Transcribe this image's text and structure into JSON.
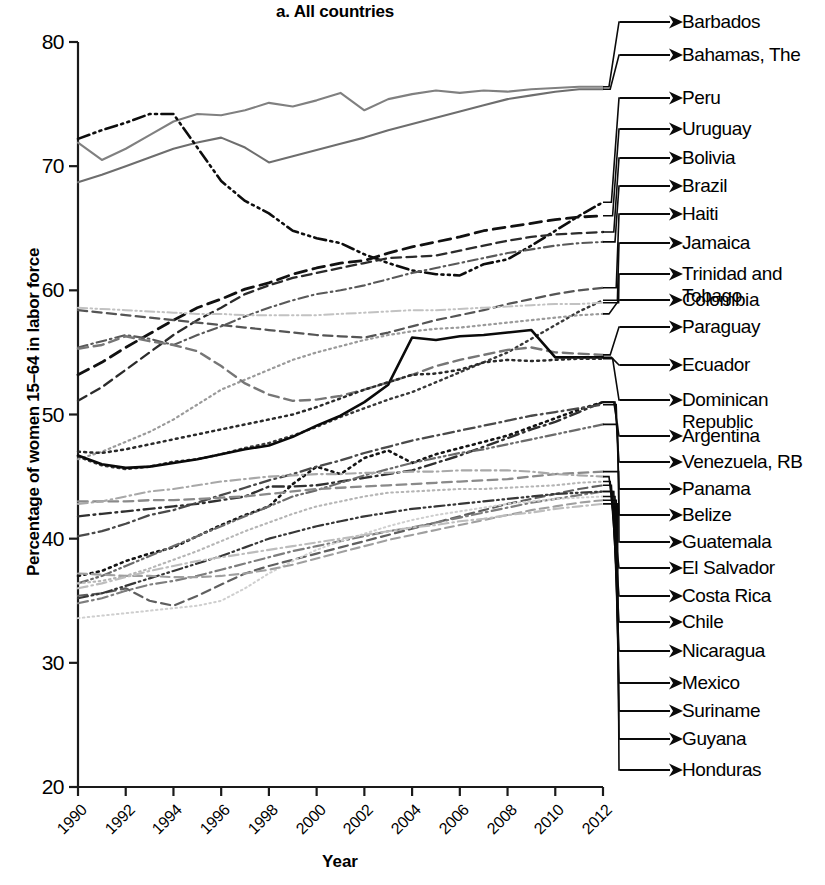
{
  "chart_data": {
    "type": "line",
    "title": "a. All countries",
    "xlabel": "Year",
    "ylabel": "Percentage of women 15–64 in labor force",
    "xlim": [
      1990,
      2012
    ],
    "ylim": [
      20,
      80
    ],
    "xticks": [
      "1990",
      "1992",
      "1994",
      "1996",
      "1998",
      "2000",
      "2002",
      "2004",
      "2006",
      "2008",
      "2010",
      "2012"
    ],
    "yticks": [
      "20",
      "30",
      "40",
      "50",
      "60",
      "70",
      "80"
    ],
    "grid": false,
    "legend_position": "right-leader-lines",
    "x": [
      1990,
      1991,
      1992,
      1993,
      1994,
      1995,
      1996,
      1997,
      1998,
      1999,
      2000,
      2001,
      2002,
      2003,
      2004,
      2005,
      2006,
      2007,
      2008,
      2009,
      2010,
      2011,
      2012
    ],
    "series": [
      {
        "name": "Barbados",
        "style": "solid",
        "shade": "#808080",
        "width": 2.1,
        "values": [
          71.9,
          70.5,
          71.4,
          72.5,
          73.6,
          74.2,
          74.1,
          74.5,
          75.1,
          74.8,
          75.3,
          75.9,
          74.5,
          75.4,
          75.8,
          76.1,
          75.9,
          76.1,
          76.0,
          76.2,
          76.3,
          76.4,
          76.4
        ]
      },
      {
        "name": "Bahamas, The",
        "style": "solid",
        "shade": "#6e6e6e",
        "width": 2.1,
        "values": [
          68.7,
          69.3,
          70.0,
          70.7,
          71.4,
          71.9,
          72.3,
          71.5,
          70.3,
          70.8,
          71.3,
          71.8,
          72.3,
          72.9,
          73.4,
          73.9,
          74.4,
          74.9,
          75.4,
          75.7,
          76.0,
          76.2,
          76.2
        ]
      },
      {
        "name": "Peru",
        "style": "dashdotdot",
        "shade": "#0d0d0d",
        "width": 2.6,
        "values": [
          72.2,
          72.9,
          73.5,
          74.2,
          74.2,
          71.5,
          68.8,
          67.2,
          66.2,
          64.8,
          64.2,
          63.8,
          62.9,
          62.2,
          61.6,
          61.3,
          61.2,
          62.1,
          62.5,
          63.6,
          64.8,
          66.0,
          67.1
        ]
      },
      {
        "name": "Uruguay",
        "style": "dashed",
        "shade": "#111111",
        "width": 2.8,
        "values": [
          53.2,
          54.2,
          55.4,
          56.5,
          57.6,
          58.6,
          59.3,
          60.1,
          60.6,
          61.3,
          61.8,
          62.2,
          62.4,
          63.0,
          63.5,
          63.9,
          64.3,
          64.8,
          65.1,
          65.4,
          65.7,
          65.9,
          66.0
        ]
      },
      {
        "name": "Bolivia",
        "style": "dashed",
        "shade": "#2b2b2b",
        "width": 2.3,
        "values": [
          51.1,
          52.2,
          53.6,
          55.0,
          56.4,
          57.6,
          58.6,
          59.7,
          60.4,
          61.0,
          61.4,
          61.8,
          62.2,
          62.6,
          62.7,
          62.8,
          63.2,
          63.6,
          64.0,
          64.3,
          64.5,
          64.6,
          64.7
        ]
      },
      {
        "name": "Brazil",
        "style": "dashdot",
        "shade": "#595959",
        "width": 2.1,
        "values": [
          55.4,
          55.9,
          56.4,
          56.1,
          55.6,
          56.4,
          57.1,
          57.9,
          58.6,
          59.2,
          59.7,
          60.0,
          60.4,
          60.9,
          61.4,
          61.8,
          62.2,
          62.6,
          63.0,
          63.3,
          63.6,
          63.8,
          63.9
        ]
      },
      {
        "name": "Haiti",
        "style": "dashed",
        "shade": "#555555",
        "width": 2.2,
        "values": [
          58.4,
          58.2,
          58.0,
          57.8,
          57.6,
          57.4,
          57.2,
          57.0,
          56.8,
          56.6,
          56.4,
          56.3,
          56.2,
          56.6,
          57.1,
          57.6,
          58.0,
          58.4,
          58.9,
          59.3,
          59.7,
          60.0,
          60.2
        ]
      },
      {
        "name": "Jamaica",
        "style": "dotted",
        "shade": "#383838",
        "width": 2.4,
        "values": [
          46.6,
          45.9,
          45.6,
          45.8,
          46.2,
          46.4,
          46.8,
          47.3,
          47.7,
          48.3,
          49.0,
          49.8,
          50.5,
          51.2,
          51.8,
          52.6,
          53.4,
          54.2,
          55.0,
          56.1,
          57.2,
          58.3,
          59.2
        ]
      },
      {
        "name": "Trinidad and Tobago",
        "style": "dashdotdot",
        "shade": "#c2c2c2",
        "width": 2.0,
        "values": [
          58.6,
          58.5,
          58.4,
          58.3,
          58.2,
          58.1,
          58.1,
          58.0,
          58.0,
          58.0,
          58.0,
          58.1,
          58.2,
          58.3,
          58.4,
          58.4,
          58.5,
          58.6,
          58.7,
          58.8,
          58.9,
          58.9,
          59.0
        ]
      },
      {
        "name": "Colombia",
        "style": "dotted",
        "shade": "#9a9a9a",
        "width": 2.2,
        "values": [
          46.4,
          47.0,
          47.8,
          48.6,
          49.6,
          50.8,
          52.0,
          52.8,
          53.6,
          54.4,
          55.0,
          55.5,
          56.0,
          56.4,
          56.7,
          56.9,
          57.0,
          57.2,
          57.4,
          57.6,
          57.8,
          58.0,
          58.1
        ]
      },
      {
        "name": "Paraguay",
        "style": "dashed",
        "shade": "#767676",
        "width": 2.4,
        "values": [
          55.3,
          55.6,
          56.3,
          55.9,
          55.6,
          55.1,
          53.9,
          52.5,
          51.6,
          51.1,
          51.2,
          51.5,
          52.0,
          52.6,
          53.2,
          53.9,
          54.4,
          54.8,
          55.2,
          55.4,
          55.0,
          54.9,
          54.8
        ]
      },
      {
        "name": "Ecuador",
        "style": "solid",
        "shade": "#0a0a0a",
        "width": 2.6,
        "values": [
          46.7,
          46.0,
          45.7,
          45.8,
          46.1,
          46.4,
          46.8,
          47.2,
          47.5,
          48.2,
          49.1,
          49.9,
          51.0,
          52.4,
          56.2,
          56.0,
          56.3,
          56.4,
          56.6,
          56.8,
          54.6,
          54.6,
          54.6
        ]
      },
      {
        "name": "Dominican Republic",
        "style": "dotted",
        "shade": "#2a2a2a",
        "width": 2.5,
        "values": [
          47.0,
          46.9,
          47.2,
          47.6,
          48.0,
          48.4,
          48.8,
          49.2,
          49.6,
          50.0,
          50.6,
          51.3,
          52.0,
          52.6,
          53.2,
          53.3,
          53.6,
          54.2,
          54.4,
          54.3,
          54.4,
          54.5,
          54.5
        ]
      },
      {
        "name": "Argentina",
        "style": "dashdot",
        "shade": "#303030",
        "width": 2.4,
        "values": [
          41.8,
          42.0,
          42.2,
          42.4,
          42.6,
          42.8,
          43.1,
          43.4,
          44.2,
          44.2,
          44.3,
          44.6,
          44.9,
          45.2,
          45.5,
          46.1,
          46.7,
          47.4,
          48.1,
          48.8,
          49.4,
          50.2,
          51.0
        ]
      },
      {
        "name": "Venezuela, RB",
        "style": "dotted",
        "shade": "#141414",
        "width": 2.6,
        "values": [
          37.0,
          37.4,
          38.2,
          38.8,
          39.3,
          40.2,
          41.1,
          41.9,
          42.6,
          44.4,
          45.8,
          45.2,
          46.5,
          47.1,
          46.1,
          46.8,
          47.3,
          47.8,
          48.3,
          49.0,
          49.7,
          50.4,
          51.0
        ]
      },
      {
        "name": "Panama",
        "style": "dashdot",
        "shade": "#4a4a4a",
        "width": 2.3,
        "values": [
          40.2,
          40.6,
          41.2,
          41.9,
          42.3,
          42.9,
          43.5,
          44.1,
          44.7,
          45.2,
          45.8,
          46.3,
          46.9,
          47.4,
          47.9,
          48.3,
          48.7,
          49.1,
          49.5,
          49.9,
          50.2,
          50.5,
          50.8
        ]
      },
      {
        "name": "Belize",
        "style": "dashdotdot",
        "shade": "#6b6b6b",
        "width": 2.2,
        "values": [
          36.4,
          37.0,
          37.8,
          38.6,
          39.4,
          40.2,
          41.0,
          41.8,
          42.6,
          43.4,
          43.9,
          44.5,
          45.1,
          45.6,
          46.1,
          46.5,
          46.9,
          47.2,
          47.6,
          48.0,
          48.4,
          48.8,
          49.2
        ]
      },
      {
        "name": "Guatemala",
        "style": "dashed",
        "shade": "#8a8a8a",
        "width": 2.3,
        "values": [
          43.0,
          43.0,
          43.0,
          43.1,
          43.1,
          43.2,
          43.3,
          43.4,
          43.6,
          43.8,
          44.0,
          44.1,
          44.2,
          44.3,
          44.4,
          44.5,
          44.6,
          44.7,
          44.8,
          45.0,
          45.2,
          45.3,
          45.4
        ]
      },
      {
        "name": "El Salvador",
        "style": "dashdot",
        "shade": "#a8a8a8",
        "width": 2.1,
        "values": [
          42.8,
          43.0,
          43.4,
          43.8,
          44.0,
          44.3,
          44.6,
          44.8,
          45.0,
          45.1,
          45.2,
          45.2,
          45.3,
          45.3,
          45.4,
          45.4,
          45.5,
          45.5,
          45.5,
          45.4,
          45.2,
          45.1,
          45.0
        ]
      },
      {
        "name": "Costa Rica",
        "style": "dotted",
        "shade": "#b5b5b5",
        "width": 2.1,
        "values": [
          36.4,
          36.6,
          37.0,
          37.6,
          38.3,
          39.0,
          39.8,
          40.6,
          41.3,
          42.0,
          42.6,
          43.0,
          43.4,
          43.7,
          43.8,
          43.9,
          44.0,
          44.0,
          44.1,
          44.2,
          44.3,
          44.5,
          44.6
        ]
      },
      {
        "name": "Chile",
        "style": "dashed",
        "shade": "#5f5f5f",
        "width": 2.2,
        "values": [
          35.4,
          35.6,
          36.0,
          35.0,
          34.6,
          35.4,
          36.3,
          37.2,
          37.8,
          38.3,
          38.8,
          39.3,
          39.8,
          40.3,
          40.8,
          41.3,
          41.8,
          42.3,
          42.8,
          43.2,
          43.6,
          44.0,
          44.3
        ]
      },
      {
        "name": "Nicaragua",
        "style": "dashdot",
        "shade": "#7d7d7d",
        "width": 2.2,
        "values": [
          34.8,
          35.2,
          35.8,
          36.3,
          36.6,
          37.0,
          37.5,
          38.0,
          38.5,
          39.0,
          39.4,
          39.8,
          40.2,
          40.6,
          40.9,
          41.3,
          41.7,
          42.1,
          42.5,
          42.9,
          43.2,
          43.5,
          43.8
        ]
      },
      {
        "name": "Mexico",
        "style": "dashdotdot",
        "shade": "#373737",
        "width": 2.2,
        "values": [
          35.2,
          35.6,
          36.2,
          36.8,
          37.4,
          38.0,
          38.6,
          39.3,
          40.0,
          40.5,
          41.0,
          41.4,
          41.8,
          42.1,
          42.4,
          42.6,
          42.8,
          43.0,
          43.2,
          43.4,
          43.6,
          43.7,
          43.8
        ]
      },
      {
        "name": "Suriname",
        "style": "dotted",
        "shade": "#cfcfcf",
        "width": 2.0,
        "values": [
          33.6,
          33.8,
          34.0,
          34.2,
          34.4,
          34.6,
          35.0,
          36.0,
          37.2,
          38.2,
          39.1,
          39.8,
          40.4,
          41.0,
          41.5,
          41.9,
          42.2,
          42.5,
          42.8,
          43.0,
          43.2,
          43.3,
          43.4
        ]
      },
      {
        "name": "Guyana",
        "style": "dashed",
        "shade": "#9f9f9f",
        "width": 2.1,
        "values": [
          37.2,
          37.1,
          37.0,
          37.0,
          36.9,
          36.9,
          37.0,
          37.2,
          37.5,
          37.9,
          38.4,
          38.9,
          39.4,
          39.9,
          40.3,
          40.7,
          41.1,
          41.5,
          41.9,
          42.3,
          42.6,
          42.9,
          43.1
        ]
      },
      {
        "name": "Honduras",
        "style": "dashdot",
        "shade": "#bdbdbd",
        "width": 2.1,
        "values": [
          36.0,
          36.4,
          36.9,
          37.4,
          37.8,
          38.2,
          38.5,
          38.8,
          39.1,
          39.4,
          39.7,
          40.0,
          40.3,
          40.6,
          40.9,
          41.1,
          41.4,
          41.6,
          41.9,
          42.1,
          42.4,
          42.6,
          42.8
        ]
      }
    ]
  },
  "legend": {
    "entries": [
      {
        "label": "Barbados"
      },
      {
        "label": "Bahamas, The"
      },
      {
        "label": "Peru"
      },
      {
        "label": "Uruguay"
      },
      {
        "label": "Bolivia"
      },
      {
        "label": "Brazil"
      },
      {
        "label": "Haiti"
      },
      {
        "label": "Jamaica"
      },
      {
        "label": "Trinidad and\nTobago"
      },
      {
        "label": "Colombia"
      },
      {
        "label": "Paraguay"
      },
      {
        "label": "Ecuador"
      },
      {
        "label": "Dominican\nRepublic"
      },
      {
        "label": "Argentina"
      },
      {
        "label": "Venezuela, RB"
      },
      {
        "label": "Panama"
      },
      {
        "label": "Belize"
      },
      {
        "label": "Guatemala"
      },
      {
        "label": "El Salvador"
      },
      {
        "label": "Costa Rica"
      },
      {
        "label": "Chile"
      },
      {
        "label": "Nicaragua"
      },
      {
        "label": "Mexico"
      },
      {
        "label": "Suriname"
      },
      {
        "label": "Guyana"
      },
      {
        "label": "Honduras"
      }
    ]
  }
}
